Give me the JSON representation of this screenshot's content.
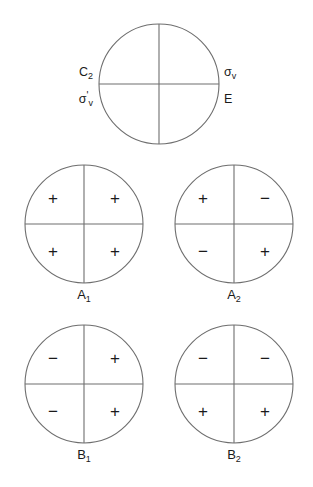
{
  "figure": {
    "background_color": "#ffffff",
    "line_color": "#6e6e6e",
    "text_color": "#1a1a1a"
  },
  "operation_circle": {
    "name": "operation-reference-circle",
    "center": {
      "x": 159,
      "y": 84
    },
    "radius": 60,
    "labels": [
      {
        "id": "c2",
        "base": "C",
        "sub": "2",
        "prime": "",
        "x": 93,
        "y": 76,
        "anchor": "end"
      },
      {
        "id": "sigma-v",
        "base": "σ",
        "sub": "v",
        "prime": "",
        "x": 224,
        "y": 76,
        "anchor": "start"
      },
      {
        "id": "sigma-v-prime",
        "base": "σ",
        "sub": "v",
        "prime": "'",
        "x": 93,
        "y": 103,
        "anchor": "end"
      },
      {
        "id": "identity-e",
        "base": "E",
        "sub": "",
        "prime": "",
        "x": 224,
        "y": 103,
        "anchor": "start"
      }
    ]
  },
  "symmetry_sets": [
    {
      "id": "a1",
      "label_base": "A",
      "label_sub": "1",
      "center": {
        "x": 84,
        "y": 224
      },
      "radius": 59,
      "label_y": 299,
      "signs": {
        "top_left": "+",
        "top_right": "+",
        "bottom_left": "+",
        "bottom_right": "+"
      }
    },
    {
      "id": "a2",
      "label_base": "A",
      "label_sub": "2",
      "center": {
        "x": 234,
        "y": 224
      },
      "radius": 59,
      "label_y": 299,
      "signs": {
        "top_left": "+",
        "top_right": "−",
        "bottom_left": "−",
        "bottom_right": "+"
      }
    },
    {
      "id": "b1",
      "label_base": "B",
      "label_sub": "1",
      "center": {
        "x": 84,
        "y": 384
      },
      "radius": 59,
      "label_y": 459,
      "signs": {
        "top_left": "−",
        "top_right": "+",
        "bottom_left": "−",
        "bottom_right": "+"
      }
    },
    {
      "id": "b2",
      "label_base": "B",
      "label_sub": "2",
      "center": {
        "x": 234,
        "y": 384
      },
      "radius": 59,
      "label_y": 459,
      "signs": {
        "top_left": "−",
        "top_right": "−",
        "bottom_left": "+",
        "bottom_right": "+"
      }
    }
  ]
}
